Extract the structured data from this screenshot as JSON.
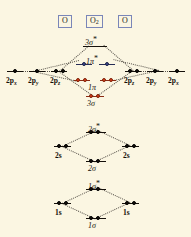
{
  "figure": {
    "background_color": "#fbf6e2",
    "width": 191,
    "height": 237
  },
  "species_labels": [
    {
      "name": "left-atom",
      "text": "O",
      "sub": ""
    },
    {
      "name": "molecule",
      "text": "O",
      "sub": "2"
    },
    {
      "name": "right-atom",
      "text": "O",
      "sub": ""
    }
  ],
  "colors": {
    "electron_black": "#15100a",
    "electron_red": "#d83c18",
    "electron_blue": "#3c4a8e",
    "level_black": "#15100a",
    "level_red": "#8a2b14",
    "level_blue": "#262c55",
    "box_border": "#7a86b8",
    "connector": "#57524a"
  },
  "blocks": {
    "p_block": {
      "name": "2p block",
      "atomic_orbitals_left": [
        {
          "label": "2p",
          "sub": "x",
          "electrons": 1
        },
        {
          "label": "2p",
          "sub": "y",
          "electrons": 1
        },
        {
          "label": "2p",
          "sub": "z",
          "electrons": 2
        }
      ],
      "atomic_orbitals_right": [
        {
          "label": "2p",
          "sub": "z",
          "electrons": 2
        },
        {
          "label": "2p",
          "sub": "y",
          "electrons": 1
        },
        {
          "label": "2p",
          "sub": "x",
          "electrons": 1
        }
      ],
      "molecular_orbitals": [
        {
          "label": "3σ",
          "star": true,
          "electrons": 0,
          "color": "black",
          "degeneracy": 1
        },
        {
          "label": "1π",
          "star": true,
          "electrons": 1,
          "color": "blue",
          "degeneracy": 2
        },
        {
          "label": "1π",
          "star": false,
          "electrons": 2,
          "color": "red",
          "degeneracy": 2
        },
        {
          "label": "3σ",
          "star": false,
          "electrons": 2,
          "color": "red",
          "degeneracy": 1
        }
      ]
    },
    "s2_block": {
      "name": "2s block",
      "atomic_orbital": {
        "label": "2s",
        "electrons": 2
      },
      "molecular_orbitals": [
        {
          "label": "2σ",
          "star": true,
          "electrons": 2
        },
        {
          "label": "2σ",
          "star": false,
          "electrons": 2
        }
      ]
    },
    "s1_block": {
      "name": "1s block",
      "atomic_orbital": {
        "label": "1s",
        "electrons": 2
      },
      "molecular_orbitals": [
        {
          "label": "1σ",
          "star": true,
          "electrons": 2
        },
        {
          "label": "1σ",
          "star": false,
          "electrons": 2
        }
      ]
    }
  },
  "labels": {
    "sigma3_star": "3σ",
    "pi1_star": "1π",
    "pi1": "1π",
    "sigma3": "3σ",
    "sigma2_star": "2σ",
    "sigma2": "2σ",
    "sigma1_star": "1σ",
    "sigma1": "1σ",
    "two_s": "2s",
    "one_s": "1s",
    "two_p": "2p",
    "sub_x": "x",
    "sub_y": "y",
    "sub_z": "z",
    "star_mark": "*"
  }
}
